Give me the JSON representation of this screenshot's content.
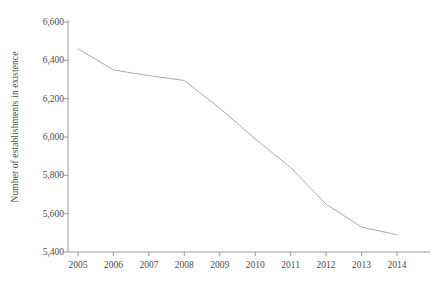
{
  "chart_data": {
    "type": "line",
    "title": "",
    "subtitle": "",
    "xlabel": "",
    "ylabel": "Number of establishments in existence",
    "categories": [
      "2005",
      "2006",
      "2007",
      "2008",
      "2009",
      "2010",
      "2011",
      "2012",
      "2013",
      "2014"
    ],
    "x": [
      2005,
      2006,
      2007,
      2008,
      2009,
      2010,
      2011,
      2012,
      2013,
      2014
    ],
    "values": [
      6460,
      6350,
      6320,
      6295,
      6150,
      5990,
      5840,
      5650,
      5530,
      5490
    ],
    "series": [
      {
        "name": "Number of establishments in existence",
        "values": [
          6460,
          6350,
          6320,
          6295,
          6150,
          5990,
          5840,
          5650,
          5530,
          5490
        ]
      }
    ],
    "ylim": [
      5400,
      6600
    ],
    "yticks": [
      5400,
      5600,
      5800,
      6000,
      6200,
      6400,
      6600
    ],
    "ytick_labels": [
      "5,400",
      "5,600",
      "5,800",
      "6,000",
      "6,200",
      "6,400",
      "6,600"
    ],
    "xlim": [
      2005,
      2014
    ],
    "xticks": [
      2005,
      2006,
      2007,
      2008,
      2009,
      2010,
      2011,
      2012,
      2013,
      2014
    ],
    "xtick_labels": [
      "2005",
      "2006",
      "2007",
      "2008",
      "2009",
      "2010",
      "2011",
      "2012",
      "2013",
      "2014"
    ],
    "grid": false,
    "legend": false,
    "legend_position": "none",
    "line_color": "#aaaaaa",
    "axis_color": "#888888",
    "text_color": "#4a4a4a",
    "background_color": "#ffffff",
    "annotations": []
  }
}
